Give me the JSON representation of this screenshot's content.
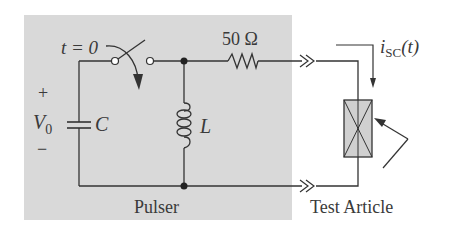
{
  "diagram": {
    "type": "circuit-schematic",
    "background_color": "#ffffff",
    "pulser_box_color": "#d9d9d9",
    "wire_color": "#333333",
    "labels": {
      "switch_time": "t = 0",
      "source_plus": "+",
      "source_voltage_main": "V",
      "source_voltage_sub": "0",
      "source_minus": "−",
      "capacitor": "C",
      "inductor": "L",
      "resistor": "50 Ω",
      "current_main": "i",
      "current_sub": "SC",
      "current_arg": "(t)",
      "pulser": "Pulser",
      "test_article": "Test Article"
    },
    "components": [
      {
        "id": "switch",
        "kind": "switch",
        "closes_at": "t = 0"
      },
      {
        "id": "capacitor",
        "kind": "capacitor",
        "label": "C",
        "initial_voltage": "V0"
      },
      {
        "id": "inductor",
        "kind": "inductor",
        "label": "L"
      },
      {
        "id": "resistor",
        "kind": "resistor",
        "value": "50 Ω"
      },
      {
        "id": "test-article",
        "kind": "load",
        "label": "Test Article"
      }
    ]
  }
}
